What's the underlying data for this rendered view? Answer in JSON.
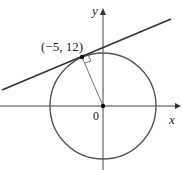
{
  "diagram": {
    "point_label": "(−5, 12)",
    "origin_label": "0",
    "x_axis_label": "x",
    "y_axis_label": "y",
    "colors": {
      "circle": "#555555",
      "line": "#333333",
      "axes": "#444444"
    }
  }
}
